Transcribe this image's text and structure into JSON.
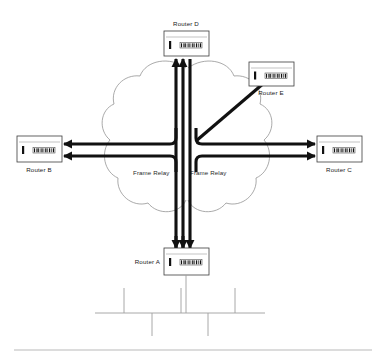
{
  "diagram": {
    "background_color": "#ffffff",
    "line_color": "#111111",
    "cloud_color": "#8d8d8d",
    "lan_color": "#9e9e9e",
    "nodes": [
      {
        "id": "router-d",
        "label": "Router D",
        "icon": "router-icon",
        "label_position": "above",
        "box": {
          "x": 164,
          "y": 31,
          "w": 45,
          "h": 25
        }
      },
      {
        "id": "router-e",
        "label": "Router E",
        "icon": "router-icon",
        "label_position": "below",
        "box": {
          "x": 249,
          "y": 62,
          "w": 45,
          "h": 24
        }
      },
      {
        "id": "router-b",
        "label": "Router B",
        "icon": "router-icon",
        "label_position": "below",
        "box": {
          "x": 17,
          "y": 136,
          "w": 45,
          "h": 26
        }
      },
      {
        "id": "router-c",
        "label": "Router C",
        "icon": "router-icon",
        "label_position": "below",
        "box": {
          "x": 317,
          "y": 136,
          "w": 45,
          "h": 26
        }
      },
      {
        "id": "router-a",
        "label": "Router A",
        "icon": "router-icon",
        "label_position": "left",
        "box": {
          "x": 164,
          "y": 248,
          "w": 45,
          "h": 27
        }
      }
    ],
    "clouds": [
      {
        "id": "frame-relay-left",
        "label": "Frame Relay"
      },
      {
        "id": "frame-relay-right",
        "label": "Frame Relay"
      }
    ],
    "links": [
      {
        "id": "link-a-to-d-1",
        "from": "Router A",
        "to": "Router D",
        "arrow": "up"
      },
      {
        "id": "link-a-to-d-2",
        "from": "Router A",
        "to": "Router D",
        "arrow": "up"
      },
      {
        "id": "link-d-to-a-1",
        "from": "Router D",
        "to": "Router A",
        "arrow": "down"
      },
      {
        "id": "link-to-b-upper",
        "from": "Frame Relay",
        "to": "Router B",
        "arrow": "left"
      },
      {
        "id": "link-to-b-lower",
        "from": "Frame Relay",
        "to": "Router B",
        "arrow": "left"
      },
      {
        "id": "link-to-c-upper",
        "from": "Frame Relay",
        "to": "Router C",
        "arrow": "right"
      },
      {
        "id": "link-to-c-lower",
        "from": "Frame Relay",
        "to": "Router C",
        "arrow": "right"
      },
      {
        "id": "link-to-e",
        "from": "Frame Relay",
        "to": "Router E",
        "arrow": "diagonal-up-right"
      }
    ],
    "lan": {
      "id": "lan-bus",
      "label": "",
      "bus_y": 313,
      "bus_x1": 95,
      "bus_x2": 265,
      "stubs_up": [
        124,
        181,
        235
      ],
      "stubs_down": [
        152,
        208
      ],
      "drop_from": "Router A"
    }
  }
}
